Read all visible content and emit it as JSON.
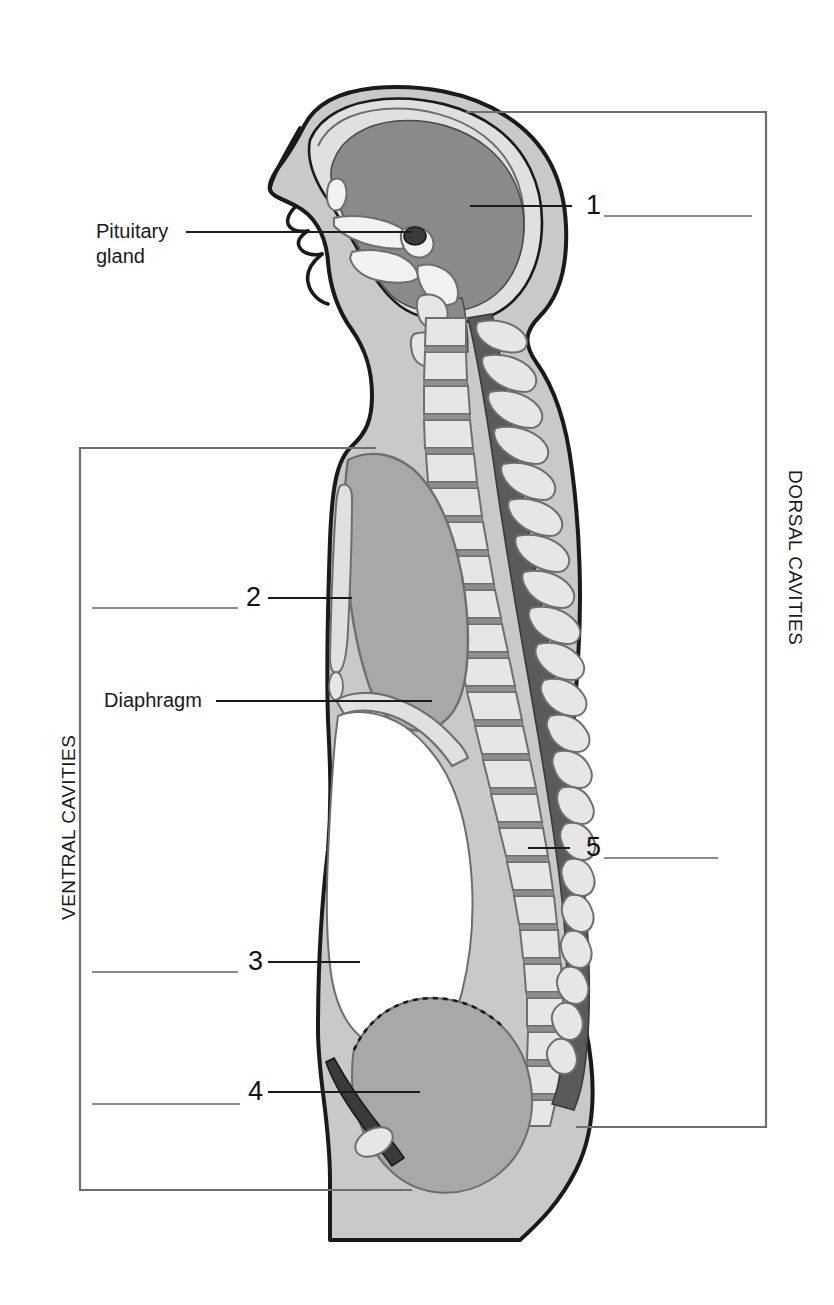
{
  "figure": {
    "type": "anatomy-diagram",
    "orientation": "left lateral profile facing left"
  },
  "text_labels": {
    "pituitary_line1": "Pituitary",
    "pituitary_line2": "gland",
    "diaphragm": "Diaphragm"
  },
  "bracket_labels": {
    "dorsal": "DORSAL CAVITIES",
    "ventral": "VENTRAL CAVITIES"
  },
  "numbered_callouts": [
    {
      "number": "1",
      "side": "right",
      "answer_blank": true
    },
    {
      "number": "2",
      "side": "left",
      "answer_blank": true
    },
    {
      "number": "3",
      "side": "left",
      "answer_blank": true
    },
    {
      "number": "4",
      "side": "left",
      "answer_blank": true
    },
    {
      "number": "5",
      "side": "right",
      "answer_blank": true
    }
  ],
  "colors": {
    "outline": "#1a1a1a",
    "body_fill": "#c9c9c9",
    "bone_fill": "#e0e0e0",
    "brain_fill": "#8a8a8a",
    "cavity_fill": "#a8a8a8",
    "cord_fill": "#5a5a5a",
    "white": "#ffffff",
    "leader_line": "#1a1a1a",
    "blank_line": "#8c8c8c",
    "bracket_line": "#6e6e6e"
  }
}
